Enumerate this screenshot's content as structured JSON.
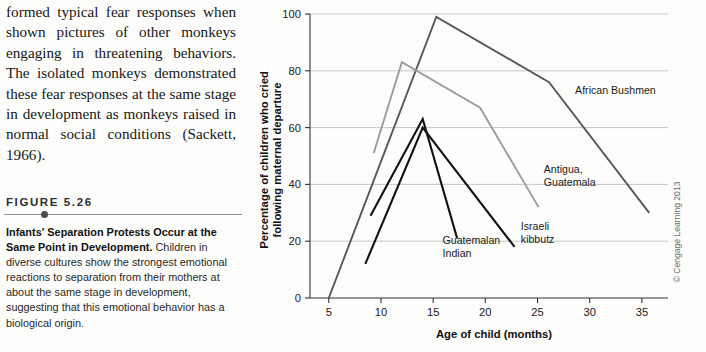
{
  "page": {
    "body_text": "formed typical fear responses when shown pictures of other monkeys engaging in threatening behaviors. The isolated monkeys demonstrated these fear responses at the same stage in development as monkeys raised in normal social conditions (Sackett, 1966)."
  },
  "figure": {
    "number_label": "FIGURE 5.26",
    "caption_lead": "Infants' Separation Protests Occur at the Same Point in Development.",
    "caption_body": " Children in diverse cultures show the strongest emotional reactions to separation from their mothers at about the same stage in development, suggesting that this emotional behavior has a biological origin.",
    "copyright": "© Cengage Learning 2013"
  },
  "chart_data": {
    "type": "line",
    "title": "",
    "xlabel": "Age of child (months)",
    "ylabel": "Percentage of children who cried following maternal departure",
    "xlim": [
      3.2,
      37.5
    ],
    "ylim": [
      0,
      100
    ],
    "xticks": [
      5,
      10,
      15,
      20,
      25,
      30,
      35
    ],
    "yticks": [
      0,
      20,
      40,
      60,
      80,
      100
    ],
    "grid": "horizontal",
    "legend": "inline-annotations",
    "series": [
      {
        "name": "African Bushmen",
        "color": "#58595b",
        "width": 1.9,
        "label_x": 28.6,
        "label_y": 72,
        "points": [
          [
            5.0,
            0
          ],
          [
            15.3,
            99
          ],
          [
            26.1,
            76
          ],
          [
            35.7,
            30
          ]
        ]
      },
      {
        "name": "Antigua, Guatemala",
        "color": "#9c9c9e",
        "width": 1.9,
        "label_x": 25.6,
        "label_y": 44,
        "points": [
          [
            9.3,
            51
          ],
          [
            12.0,
            83
          ],
          [
            19.5,
            67
          ],
          [
            25.1,
            32
          ]
        ]
      },
      {
        "name": "Guatemalan Indian",
        "color": "#111111",
        "width": 2.1,
        "label_x": 15.9,
        "label_y": 19,
        "points": [
          [
            9.0,
            29
          ],
          [
            14.0,
            63
          ],
          [
            17.3,
            21
          ]
        ]
      },
      {
        "name": "Israeli kibbutz",
        "color": "#111111",
        "width": 2.1,
        "label_x": 23.4,
        "label_y": 24,
        "points": [
          [
            8.5,
            12
          ],
          [
            14.0,
            60
          ],
          [
            22.8,
            18
          ]
        ]
      }
    ]
  }
}
